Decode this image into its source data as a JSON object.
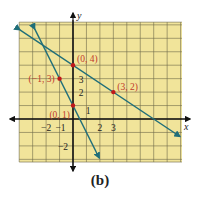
{
  "figure": {
    "caption": "(b)",
    "grid_color": "#f1e49a",
    "grid_line_color": "#6e6a4a",
    "line_color": "#1f6e79",
    "point_color": "#c0181a",
    "label_color": "#c0392b",
    "axis_labels": {
      "x": "x",
      "y": "y"
    }
  },
  "chart_data": {
    "type": "line",
    "title": "",
    "caption": "(b)",
    "xlabel": "x",
    "ylabel": "y",
    "xlim": [
      -4,
      8
    ],
    "ylim": [
      -3,
      7
    ],
    "grid": true,
    "x_tick_labels": [
      "-2",
      "-1",
      "2",
      "3"
    ],
    "y_tick_labels": [
      "3",
      "2",
      "1",
      "-2"
    ],
    "series": [
      {
        "name": "y = -2x + 1",
        "points": [
          [
            -1,
            3
          ],
          [
            0,
            1
          ]
        ],
        "slope": -2,
        "intercept": 1
      },
      {
        "name": "y = -2/3x + 4",
        "points": [
          [
            0,
            4
          ],
          [
            3,
            2
          ]
        ],
        "slope": -0.6667,
        "intercept": 4
      }
    ],
    "labeled_points": [
      {
        "label": "(0, 4)",
        "x": 0,
        "y": 4
      },
      {
        "label": "(-1, 3)",
        "x": -1,
        "y": 3
      },
      {
        "label": "(3, 2)",
        "x": 3,
        "y": 2
      },
      {
        "label": "(0, 1)",
        "x": 0,
        "y": 1
      }
    ]
  }
}
